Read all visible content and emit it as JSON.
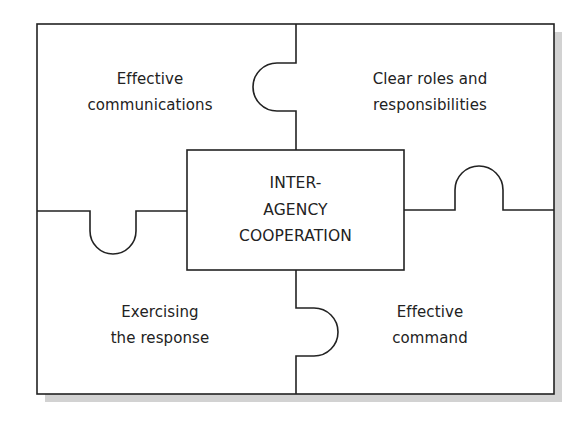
{
  "diagram": {
    "type": "jigsaw-puzzle",
    "center": {
      "lines": [
        "INTER-",
        "AGENCY",
        "COOPERATION"
      ]
    },
    "pieces": [
      {
        "position": "top-left",
        "lines": [
          "Effective",
          "communications"
        ]
      },
      {
        "position": "top-right",
        "lines": [
          "Clear roles and",
          "responsibilities"
        ]
      },
      {
        "position": "bottom-left",
        "lines": [
          "Exercising",
          "the response"
        ]
      },
      {
        "position": "bottom-right",
        "lines": [
          "Effective",
          "command"
        ]
      }
    ],
    "colors": {
      "stroke": "#222222",
      "shadow": "#d2d2d2",
      "background": "#ffffff"
    }
  }
}
